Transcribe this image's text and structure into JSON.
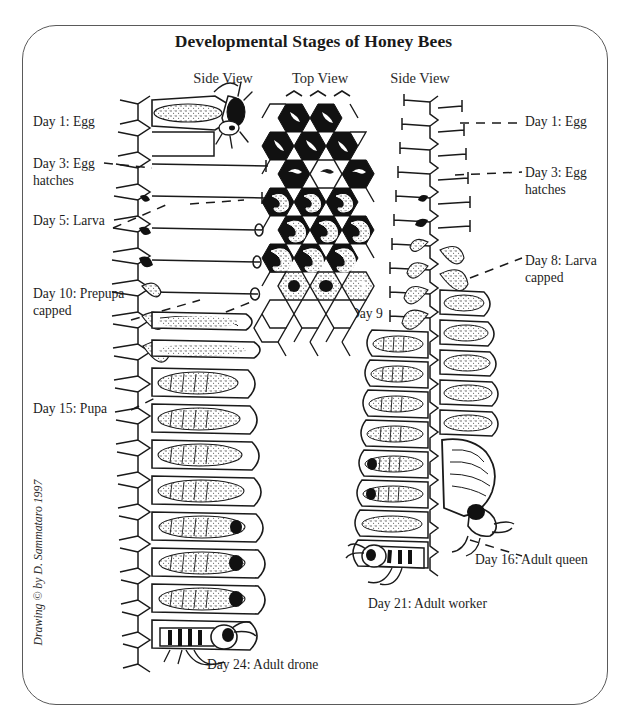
{
  "figure": {
    "title": "Developmental Stages of Honey Bees",
    "credit": "Drawing © by D. Sammataro 1997",
    "column_headers": [
      {
        "id": "left",
        "label": "Side View"
      },
      {
        "id": "mid",
        "label": "Top View"
      },
      {
        "id": "right",
        "label": "Side View"
      }
    ]
  },
  "labels": {
    "left_column": [
      {
        "id": "day1-egg",
        "text": "Day 1: Egg"
      },
      {
        "id": "day3-egg-hatch",
        "text": "Day 3: Egg"
      },
      {
        "id": "day3-egg-hatch2",
        "text": "hatches"
      },
      {
        "id": "day5-larva",
        "text": "Day 5: Larva"
      },
      {
        "id": "day10-prepupa",
        "text": "Day 10: Prepupa"
      },
      {
        "id": "day10-prepupa2",
        "text": "capped"
      },
      {
        "id": "day15-pupa",
        "text": "Day 15: Pupa"
      },
      {
        "id": "day24-drone",
        "text": "Day 24:  Adult drone"
      }
    ],
    "center_column": [
      {
        "id": "day9",
        "text": "Day 9"
      }
    ],
    "right_column": [
      {
        "id": "day1-egg",
        "text": "Day 1: Egg"
      },
      {
        "id": "day3-egg",
        "text": "Day 3: Egg"
      },
      {
        "id": "day3-egg2",
        "text": "hatches"
      },
      {
        "id": "day8-larva",
        "text": "Day 8: Larva"
      },
      {
        "id": "day8-larva2",
        "text": "capped"
      },
      {
        "id": "day16-queen",
        "text": "Day 16: Adult queen"
      },
      {
        "id": "day21-worker",
        "text": "Day 21: Adult worker"
      }
    ]
  },
  "colors": {
    "ink": "#1a1a1a",
    "border": "#5a5a5a",
    "background": "#ffffff",
    "cell_fill_dark": "#111111",
    "stipple": "#3a3a3a"
  }
}
